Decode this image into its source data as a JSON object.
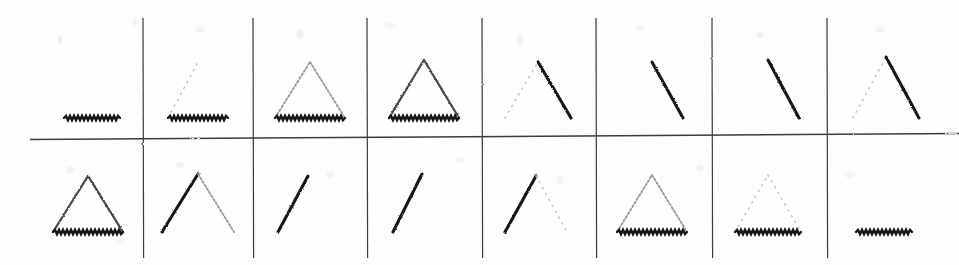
{
  "figure": {
    "title": "",
    "width": 959,
    "height": 265,
    "background_color": "#fdfdfc",
    "ink_color": "#17171a",
    "grid": {
      "rows": 2,
      "columns": 8,
      "vertical_separator_x": [
        143,
        253,
        367,
        482,
        596,
        712,
        827
      ],
      "horizontal_separator_y": 137,
      "horizontal_separator_x_start": 30,
      "horizontal_separator_x_end": 959,
      "line_color": "#3b3b3f",
      "line_width": 1.2
    },
    "stimulus_description": "Two rows of eight scanned line-drawing stimuli: partial triangles formed from a left edge, a right edge and a base, each edge drawn at a different contrast (bold, mid, faint or absent).",
    "cells": [
      {
        "row": 1,
        "column": 1,
        "label": "r1c1",
        "shape": "base-only",
        "center_x": 92,
        "base_y": 118,
        "base_half_width": 28,
        "apex_y": 62,
        "edges": {
          "left": "none",
          "right": "none",
          "base": "bold"
        }
      },
      {
        "row": 1,
        "column": 2,
        "label": "r1c2",
        "shape": "base-only",
        "center_x": 198,
        "base_y": 118,
        "base_half_width": 30,
        "apex_y": 62,
        "edges": {
          "left": "ghost",
          "right": "none",
          "base": "bold"
        }
      },
      {
        "row": 1,
        "column": 3,
        "label": "r1c3",
        "shape": "triangle",
        "center_x": 310,
        "base_y": 118,
        "base_half_width": 35,
        "apex_y": 62,
        "edges": {
          "left": "faint",
          "right": "faint",
          "base": "bold"
        }
      },
      {
        "row": 1,
        "column": 4,
        "label": "r1c4",
        "shape": "triangle",
        "center_x": 424,
        "base_y": 118,
        "base_half_width": 35,
        "apex_y": 60,
        "edges": {
          "left": "mid",
          "right": "mid",
          "base": "bold"
        }
      },
      {
        "row": 1,
        "column": 5,
        "label": "r1c5",
        "shape": "right-edge",
        "center_x": 538,
        "base_y": 118,
        "base_half_width": 33,
        "apex_y": 62,
        "edges": {
          "left": "ghost",
          "right": "bold",
          "base": "none"
        }
      },
      {
        "row": 1,
        "column": 6,
        "label": "r1c6",
        "shape": "right-edge",
        "center_x": 652,
        "base_y": 118,
        "base_half_width": 31,
        "apex_y": 62,
        "edges": {
          "left": "none",
          "right": "bold",
          "base": "none"
        }
      },
      {
        "row": 1,
        "column": 7,
        "label": "r1c7",
        "shape": "right-edge",
        "center_x": 768,
        "base_y": 118,
        "base_half_width": 31,
        "apex_y": 60,
        "edges": {
          "left": "none",
          "right": "bold",
          "base": "none"
        }
      },
      {
        "row": 1,
        "column": 8,
        "label": "r1c8",
        "shape": "triangle",
        "center_x": 886,
        "base_y": 118,
        "base_half_width": 33,
        "apex_y": 57,
        "edges": {
          "left": "ghost",
          "right": "bold",
          "base": "faint"
        }
      },
      {
        "row": 2,
        "column": 1,
        "label": "r2c1",
        "shape": "triangle",
        "center_x": 88,
        "base_y": 232,
        "base_half_width": 35,
        "apex_y": 176,
        "edges": {
          "left": "mid",
          "right": "mid",
          "base": "bold"
        }
      },
      {
        "row": 2,
        "column": 2,
        "label": "r2c2",
        "shape": "triangle",
        "center_x": 198,
        "base_y": 232,
        "base_half_width": 36,
        "apex_y": 174,
        "edges": {
          "left": "bold",
          "right": "faint",
          "base": "faint"
        }
      },
      {
        "row": 2,
        "column": 3,
        "label": "r2c3",
        "shape": "left-edge",
        "center_x": 308,
        "base_y": 232,
        "base_half_width": 30,
        "apex_y": 176,
        "edges": {
          "left": "bold",
          "right": "none",
          "base": "none"
        }
      },
      {
        "row": 2,
        "column": 4,
        "label": "r2c4",
        "shape": "left-edge",
        "center_x": 422,
        "base_y": 232,
        "base_half_width": 29,
        "apex_y": 174,
        "edges": {
          "left": "bold",
          "right": "none",
          "base": "none"
        }
      },
      {
        "row": 2,
        "column": 5,
        "label": "r2c5",
        "shape": "left-edge",
        "center_x": 536,
        "base_y": 232,
        "base_half_width": 31,
        "apex_y": 176,
        "edges": {
          "left": "bold",
          "right": "ghost",
          "base": "none"
        }
      },
      {
        "row": 2,
        "column": 6,
        "label": "r2c6",
        "shape": "triangle",
        "center_x": 652,
        "base_y": 232,
        "base_half_width": 35,
        "apex_y": 175,
        "edges": {
          "left": "faint",
          "right": "faint",
          "base": "bold"
        }
      },
      {
        "row": 2,
        "column": 7,
        "label": "r2c7",
        "shape": "triangle",
        "center_x": 768,
        "base_y": 232,
        "base_half_width": 33,
        "apex_y": 175,
        "edges": {
          "left": "ghost",
          "right": "ghost",
          "base": "bold"
        }
      },
      {
        "row": 2,
        "column": 8,
        "label": "r2c8",
        "shape": "base-only",
        "center_x": 884,
        "base_y": 232,
        "base_half_width": 28,
        "apex_y": 176,
        "edges": {
          "left": "none",
          "right": "none",
          "base": "bold"
        }
      }
    ]
  }
}
